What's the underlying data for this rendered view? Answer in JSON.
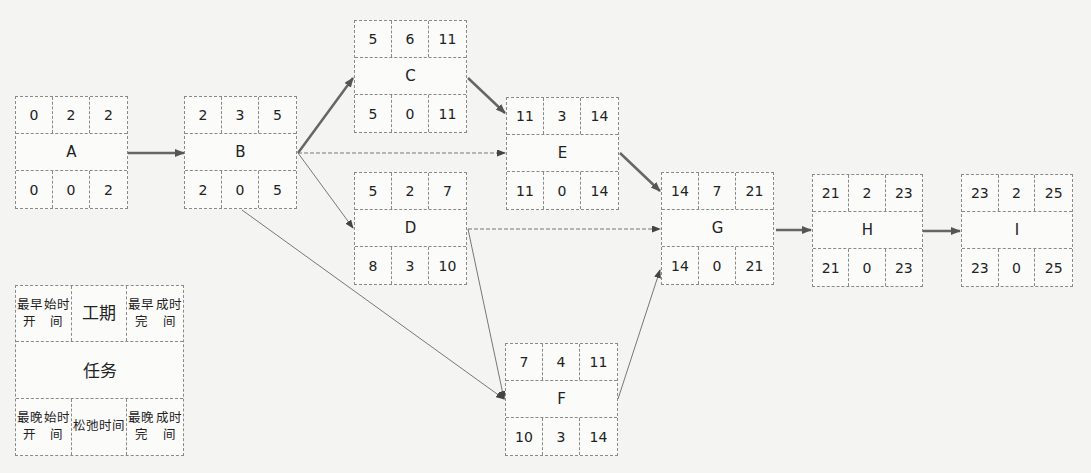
{
  "diagram": {
    "type": "activity-on-node network (critical path)",
    "nodes": [
      {
        "id": "A",
        "es": "0",
        "dur": "2",
        "ef": "2",
        "ls": "0",
        "slack": "0",
        "lf": "2"
      },
      {
        "id": "B",
        "es": "2",
        "dur": "3",
        "ef": "5",
        "ls": "2",
        "slack": "0",
        "lf": "5"
      },
      {
        "id": "C",
        "es": "5",
        "dur": "6",
        "ef": "11",
        "ls": "5",
        "slack": "0",
        "lf": "11"
      },
      {
        "id": "D",
        "es": "5",
        "dur": "2",
        "ef": "7",
        "ls": "8",
        "slack": "3",
        "lf": "10"
      },
      {
        "id": "E",
        "es": "11",
        "dur": "3",
        "ef": "14",
        "ls": "11",
        "slack": "0",
        "lf": "14"
      },
      {
        "id": "F",
        "es": "7",
        "dur": "4",
        "ef": "11",
        "ls": "10",
        "slack": "3",
        "lf": "14"
      },
      {
        "id": "G",
        "es": "14",
        "dur": "7",
        "ef": "21",
        "ls": "14",
        "slack": "0",
        "lf": "21"
      },
      {
        "id": "H",
        "es": "21",
        "dur": "2",
        "ef": "23",
        "ls": "21",
        "slack": "0",
        "lf": "23"
      },
      {
        "id": "I",
        "es": "23",
        "dur": "2",
        "ef": "25",
        "ls": "23",
        "slack": "0",
        "lf": "25"
      }
    ],
    "edges": [
      {
        "from": "A",
        "to": "B",
        "style": "critical"
      },
      {
        "from": "B",
        "to": "C",
        "style": "critical"
      },
      {
        "from": "B",
        "to": "E",
        "style": "dashed"
      },
      {
        "from": "B",
        "to": "D",
        "style": "thin"
      },
      {
        "from": "B",
        "to": "F",
        "style": "thin"
      },
      {
        "from": "C",
        "to": "E",
        "style": "critical"
      },
      {
        "from": "E",
        "to": "G",
        "style": "critical"
      },
      {
        "from": "D",
        "to": "G",
        "style": "dashed"
      },
      {
        "from": "D",
        "to": "F",
        "style": "thin"
      },
      {
        "from": "F",
        "to": "G",
        "style": "thin"
      },
      {
        "from": "G",
        "to": "H",
        "style": "critical"
      },
      {
        "from": "H",
        "to": "I",
        "style": "critical"
      }
    ],
    "colors": {
      "critical": "#666666",
      "thin": "#777777",
      "border": "#8a8a8a"
    }
  },
  "legend": {
    "es": "最早开始时间",
    "dur": "工期",
    "ef": "最早完成时间",
    "task": "任务",
    "ls": "最晚开始时间",
    "slack": "松弛时间",
    "lf": "最晚完成时间",
    "es_l1": "最早开",
    "es_l2": "始时间",
    "ef_l1": "最早完",
    "ef_l2": "成时间",
    "ls_l1": "最晚开",
    "ls_l2": "始时间",
    "slack_l1": "松弛",
    "slack_l2": "时间",
    "lf_l1": "最晚完",
    "lf_l2": "成时间"
  }
}
